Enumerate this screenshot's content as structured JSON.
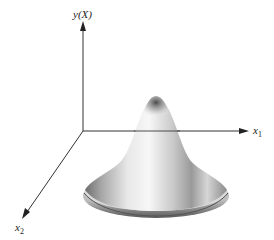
{
  "figure": {
    "type": "3D surface plot of a bell-shaped (Gaussian-like) function",
    "axes": {
      "vertical": {
        "label": "y(X)"
      },
      "horizontal": {
        "label_base": "x",
        "label_sub": "1"
      },
      "depth": {
        "label_base": "x",
        "label_sub": "2"
      }
    },
    "surface": {
      "shape": "bell",
      "shading_color": "#8a8a8a",
      "highlight_color": "#f4f4f4"
    },
    "colors": {
      "axis": "#333333",
      "background": "#ffffff"
    }
  }
}
